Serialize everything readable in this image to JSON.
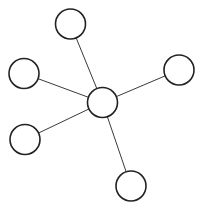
{
  "diagram": {
    "type": "star-graph",
    "width": 201,
    "height": 209,
    "background": "#ffffff",
    "node_stroke": "#222222",
    "node_fill": "#ffffff",
    "node_stroke_width": 1.6,
    "edge_stroke": "#3a3a3a",
    "edge_stroke_width": 1.0,
    "node_radius": 15,
    "hub": "center",
    "nodes": [
      {
        "id": "center",
        "x": 102.5,
        "y": 102.5,
        "label": ""
      },
      {
        "id": "top",
        "x": 70.5,
        "y": 24,
        "label": ""
      },
      {
        "id": "left-upper",
        "x": 24,
        "y": 73.5,
        "label": ""
      },
      {
        "id": "left-lower",
        "x": 25,
        "y": 139.5,
        "label": ""
      },
      {
        "id": "right",
        "x": 179,
        "y": 70,
        "label": ""
      },
      {
        "id": "bottom",
        "x": 131,
        "y": 186,
        "label": ""
      }
    ],
    "edges": [
      {
        "from": "center",
        "to": "top"
      },
      {
        "from": "center",
        "to": "left-upper"
      },
      {
        "from": "center",
        "to": "left-lower"
      },
      {
        "from": "center",
        "to": "right"
      },
      {
        "from": "center",
        "to": "bottom"
      }
    ]
  }
}
